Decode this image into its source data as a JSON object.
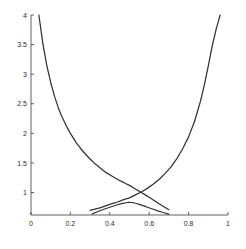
{
  "chart_data": {
    "type": "line",
    "title": "",
    "xlabel": "",
    "ylabel": "",
    "xlim": [
      0,
      1
    ],
    "ylim": [
      0.62,
      4.0
    ],
    "grid": false,
    "legend": null,
    "xticks": [
      0,
      0.2,
      0.4,
      0.6,
      0.8,
      1
    ],
    "xticklabels": [
      "0",
      "0.2",
      "0.4",
      "0.6",
      "0.8",
      "1"
    ],
    "yticks": [
      1,
      1.5,
      2,
      2.5,
      3,
      3.5,
      4
    ],
    "yticklabels": [
      "1",
      "1.5",
      "2",
      "2.5",
      "3",
      "3.5",
      "4"
    ],
    "series": [
      {
        "name": "decreasing-curve",
        "color": "#333333",
        "x": [
          0.04,
          0.06,
          0.08,
          0.1,
          0.12,
          0.14,
          0.16,
          0.18,
          0.2,
          0.23,
          0.26,
          0.29,
          0.32,
          0.35,
          0.38,
          0.41,
          0.44,
          0.47,
          0.5,
          0.53,
          0.56,
          0.6,
          0.65,
          0.7
        ],
        "y": [
          4.0,
          3.52,
          3.15,
          2.86,
          2.62,
          2.42,
          2.26,
          2.12,
          2.0,
          1.84,
          1.71,
          1.6,
          1.5,
          1.42,
          1.34,
          1.28,
          1.22,
          1.17,
          1.12,
          1.06,
          1.0,
          0.92,
          0.81,
          0.71
        ]
      },
      {
        "name": "increasing-curve",
        "color": "#333333",
        "x": [
          0.3,
          0.35,
          0.4,
          0.44,
          0.47,
          0.5,
          0.53,
          0.56,
          0.59,
          0.62,
          0.65,
          0.68,
          0.71,
          0.74,
          0.77,
          0.8,
          0.83,
          0.86,
          0.88,
          0.9,
          0.92,
          0.94,
          0.96
        ],
        "y": [
          0.7,
          0.74,
          0.8,
          0.84,
          0.88,
          0.91,
          0.96,
          1.01,
          1.07,
          1.14,
          1.22,
          1.32,
          1.43,
          1.57,
          1.74,
          1.94,
          2.2,
          2.54,
          2.82,
          3.14,
          3.48,
          3.76,
          4.0
        ]
      },
      {
        "name": "low-hump-curve",
        "color": "#333333",
        "x": [
          0.31,
          0.34,
          0.37,
          0.4,
          0.43,
          0.46,
          0.49,
          0.5,
          0.52,
          0.55,
          0.58,
          0.61,
          0.64,
          0.67,
          0.7
        ],
        "y": [
          0.635,
          0.678,
          0.716,
          0.752,
          0.784,
          0.812,
          0.832,
          0.836,
          0.828,
          0.8,
          0.766,
          0.73,
          0.694,
          0.662,
          0.635
        ]
      }
    ]
  }
}
